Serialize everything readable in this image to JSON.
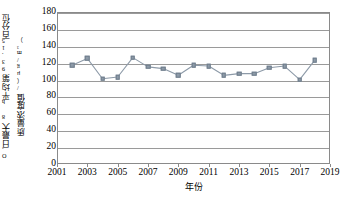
{
  "chart_data": {
    "type": "line",
    "title": "",
    "xlabel": "年份",
    "ylabel": "O₃日最大8 h平均第93.15百分位质量浓度值/（μg/m³）",
    "ylabel_parts": {
      "line1": "O₃日最大8 h平均第93.15百分位",
      "line2": "质量浓度值/（μg/m³）"
    },
    "xlim": [
      2001,
      2019
    ],
    "ylim": [
      0,
      180
    ],
    "ytick_step": 20,
    "xtick_step": 2,
    "grid": "horizontal",
    "legend": "none",
    "marker": "square",
    "line_color": "#8d9aa8",
    "marker_color": "#8d9aa8",
    "x": [
      2002,
      2003,
      2004,
      2005,
      2006,
      2007,
      2008,
      2009,
      2010,
      2011,
      2012,
      2013,
      2014,
      2015,
      2016,
      2017,
      2018
    ],
    "values": [
      117,
      125,
      101,
      103,
      126,
      115,
      113,
      105,
      117,
      116,
      105,
      107,
      107,
      114,
      116,
      100,
      123
    ],
    "yticks": [
      "0",
      "20",
      "40",
      "60",
      "80",
      "100",
      "120",
      "140",
      "160",
      "180"
    ],
    "xticks": [
      "2001",
      "2003",
      "2005",
      "2007",
      "2009",
      "2011",
      "2013",
      "2015",
      "2017",
      "2019"
    ]
  }
}
